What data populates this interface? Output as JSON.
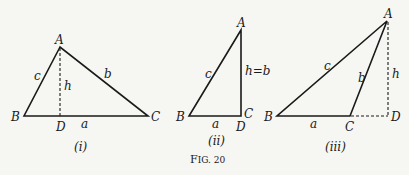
{
  "figure": {
    "caption": "Fig. 20",
    "caption_prefix": "F",
    "caption_rest": "IG. 20"
  },
  "diagrams": [
    {
      "id": "i",
      "sublabel": "(i)",
      "vertices": {
        "A": "A",
        "B": "B",
        "C": "C",
        "D": "D"
      },
      "sides": {
        "a": "a",
        "b": "b",
        "c": "c",
        "h": "h"
      },
      "description": "Acute triangle ABC with dashed altitude h from A to D on BC"
    },
    {
      "id": "ii",
      "sublabel": "(ii)",
      "vertices": {
        "A": "A",
        "B": "B",
        "C": "C",
        "D": "D"
      },
      "sides": {
        "a": "a",
        "c": "c",
        "h": "h=b"
      },
      "description": "Right triangle with right angle at C, where D coincides with C so h=b"
    },
    {
      "id": "iii",
      "sublabel": "(iii)",
      "vertices": {
        "A": "A",
        "B": "B",
        "C": "C",
        "D": "D"
      },
      "sides": {
        "a": "a",
        "b": "b",
        "c": "c",
        "h": "h"
      },
      "description": "Obtuse triangle with BC extended (dashed) to D, dashed altitude h from A to D"
    }
  ]
}
